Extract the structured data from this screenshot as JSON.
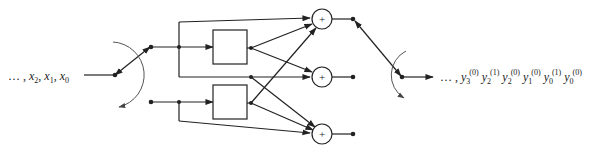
{
  "diagram": {
    "type": "polyphase filter bank / multiplexer block diagram",
    "input_label": {
      "prefix": "… , ",
      "terms": [
        {
          "base": "x",
          "sub": "2"
        },
        {
          "base": "x",
          "sub": "1"
        },
        {
          "base": "x",
          "sub": "0"
        }
      ]
    },
    "output_label": {
      "prefix": "… , ",
      "terms": [
        {
          "base": "y",
          "sub": "3",
          "sup": "(0)"
        },
        {
          "base": "y",
          "sub": "2",
          "sup": "(1)"
        },
        {
          "base": "y",
          "sub": "2",
          "sup": "(0)"
        },
        {
          "base": "y",
          "sub": "1",
          "sup": "(0)"
        },
        {
          "base": "y",
          "sub": "0",
          "sup": "(1)"
        },
        {
          "base": "y",
          "sub": "0",
          "sup": "(0)"
        }
      ]
    },
    "blocks": [
      {
        "id": "filter-top",
        "label": ""
      },
      {
        "id": "filter-bottom",
        "label": ""
      }
    ],
    "adders": [
      {
        "id": "adder-top",
        "symbol": "+"
      },
      {
        "id": "adder-middle",
        "symbol": "+"
      },
      {
        "id": "adder-bottom",
        "symbol": "+"
      }
    ],
    "switches": [
      {
        "id": "input-commutator"
      },
      {
        "id": "output-commutator"
      }
    ],
    "colors": {
      "line": "#222222",
      "arc": "#666666",
      "background": "#ffffff"
    }
  }
}
